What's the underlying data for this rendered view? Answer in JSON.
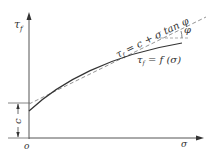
{
  "diagram": {
    "axes": {
      "y_label": "τ",
      "y_label_sub": "f",
      "x_label": "σ",
      "origin_label": "o"
    },
    "intercept_label": "c",
    "angle_label": "φ",
    "linear_envelope": {
      "lhs": "τ",
      "lhs_sub": "f",
      "rhs": " = c + σ tan φ",
      "style": "dashed"
    },
    "curved_envelope": {
      "lhs": "τ",
      "lhs_sub": "f",
      "rhs": " = f (σ)",
      "style": "solid"
    },
    "colors": {
      "line": "#333333",
      "dashed": "#888888",
      "background": "#ffffff"
    }
  }
}
